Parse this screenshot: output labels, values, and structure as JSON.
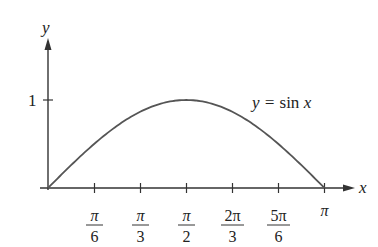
{
  "chart_data": {
    "type": "line",
    "title": "",
    "xlabel": "x",
    "ylabel": "y",
    "annotation": "y = sin x",
    "series": [
      {
        "name": "y = sin x",
        "x": [
          0,
          0.5236,
          1.0472,
          1.5708,
          2.0944,
          2.618,
          3.1416
        ],
        "values": [
          0,
          0.5,
          0.866,
          1,
          0.866,
          0.5,
          0
        ]
      }
    ],
    "x_ticks": [
      {
        "value": 0.5236,
        "num": "π",
        "den": "6"
      },
      {
        "value": 1.0472,
        "num": "π",
        "den": "3"
      },
      {
        "value": 1.5708,
        "num": "π",
        "den": "2"
      },
      {
        "value": 2.0944,
        "num": "2π",
        "den": "3"
      },
      {
        "value": 2.618,
        "num": "5π",
        "den": "6"
      },
      {
        "value": 3.1416,
        "label": "π"
      }
    ],
    "y_ticks": [
      {
        "value": 1,
        "label": "1"
      }
    ],
    "xlim": [
      0,
      3.1416
    ],
    "ylim": [
      0,
      1
    ],
    "grid": false,
    "legend": "none"
  },
  "labels": {
    "y_axis": "y",
    "x_axis": "x",
    "y_tick_1": "1",
    "curve_prefix": "y = ",
    "curve_func": "sin ",
    "curve_var": "x",
    "t1n": "π",
    "t1d": "6",
    "t2n": "π",
    "t2d": "3",
    "t3n": "π",
    "t3d": "2",
    "t4n": "2π",
    "t4d": "3",
    "t5n": "5π",
    "t5d": "6",
    "t6": "π"
  }
}
